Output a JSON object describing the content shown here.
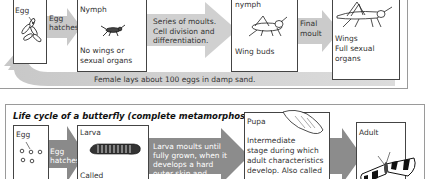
{
  "grasshopper": {
    "stages": [
      {
        "label": "Egg"
      },
      {
        "label": "Nymph",
        "description": "No wings or sexual organs"
      },
      {
        "label": "nymph",
        "description": "Wing buds"
      },
      {
        "label": "",
        "description_lines": [
          "Wings",
          "Full sexual",
          "organs"
        ]
      }
    ],
    "transitions": [
      {
        "lines": [
          "Egg",
          "hatches"
        ]
      },
      {
        "lines": [
          "Series of moults.",
          "Cell division and",
          "differentiation."
        ]
      },
      {
        "lines": [
          "Final",
          "moult"
        ]
      }
    ],
    "return_arrow_text": "Female lays about 100 eggs in damp sand.",
    "nymph_desc_lines": [
      "No wings or",
      "sexual organs"
    ]
  },
  "butterfly": {
    "title": "Life cycle of a butterfly (complete metamorphosis)",
    "stages": [
      {
        "label": "Egg",
        "partial_text": "Called"
      },
      {
        "label": "Larva",
        "partial_text": "Called"
      },
      {
        "label": "Pupa",
        "description_lines": [
          "Intermediate",
          "stage during which",
          "adult characteristics",
          "develop. Also called"
        ]
      },
      {
        "label": "Adult"
      }
    ],
    "transitions": [
      {
        "lines": [
          "Egg",
          "hatches"
        ]
      },
      {
        "lines": [
          "Larva moults until",
          "fully grown, when it",
          "develops a hard",
          "outer skin and"
        ]
      }
    ]
  },
  "colors": {
    "arrow_light": "#cfcfcf",
    "arrow_dark": "#8c8c8c",
    "border": "#444444",
    "panel_border": "#9a9a9a"
  }
}
